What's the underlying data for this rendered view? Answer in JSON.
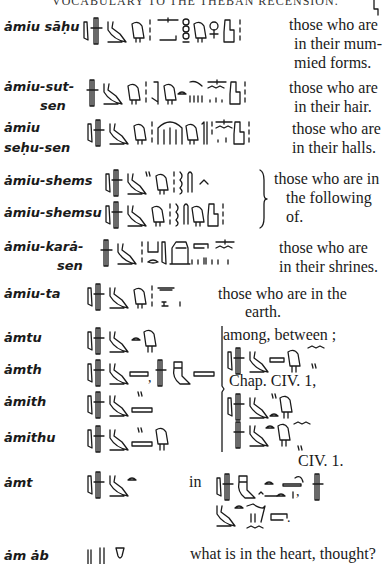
{
  "page": {
    "running_header": "VOCABULARY TO THE THEBAN RECENSION."
  },
  "entries": [
    {
      "term": "ȧmiu sāḥu",
      "definition_lines": [
        "those who are",
        "in their mum-",
        "mied  forms."
      ]
    },
    {
      "term_lines": [
        "ȧmiu-sut-",
        "sen"
      ],
      "definition_lines": [
        "those who are",
        "in their hair."
      ]
    },
    {
      "term_lines": [
        "ȧmiu",
        "seḥu-sen"
      ],
      "definition_lines": [
        "those who are",
        "in their halls."
      ]
    },
    {
      "term": "ȧmiu-shems",
      "term_alt": "ȧmiu-shemsu",
      "definition_lines": [
        "those who are in",
        "the  following",
        "of."
      ]
    },
    {
      "term_lines": [
        "ȧmiu-karȧ-",
        "sen"
      ],
      "definition_lines": [
        "those  who  are",
        "in their shrines."
      ]
    },
    {
      "term": "ȧmiu-ta",
      "definition_lines": [
        "those  who  are  in  the",
        "earth."
      ]
    },
    {
      "term": "ȧmtu",
      "definition_lines": [
        "among, between ;"
      ]
    },
    {
      "term": "ȧmth",
      "separator": ",",
      "reference_1": "Chap.  CIV.  1,"
    },
    {
      "term": "ȧmith"
    },
    {
      "term": "ȧmithu",
      "reference_2": "CIV.  1."
    },
    {
      "term": "ȧmt",
      "definition_prefix": "in",
      "trailing_punct_1": ",",
      "trailing_punct_2": "."
    },
    {
      "term": "ȧm ȧb",
      "definition_lines": [
        "what is in the heart, thought?"
      ]
    }
  ]
}
